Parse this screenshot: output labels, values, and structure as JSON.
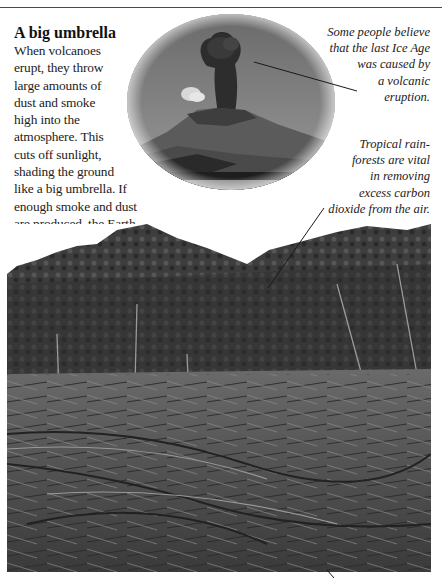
{
  "article": {
    "heading": "A big umbrella",
    "body_lines": [
      "When volcanoes",
      "erupt, they throw",
      "large amounts of",
      "dust and smoke",
      "high into the",
      "atmosphere. This",
      "cuts off sunlight,",
      "shading the ground",
      "like a big umbrella. If",
      "enough smoke and dust",
      "are produced, the Earth",
      "could get colder."
    ]
  },
  "captions": {
    "volcano": {
      "lines": [
        "Some people believe",
        "that the last Ice Age",
        "was caused by",
        "a volcanic",
        "eruption."
      ]
    },
    "forest": {
      "lines": [
        "Tropical rain-",
        "forests are vital",
        "in removing",
        "excess carbon",
        "dioxide from the air."
      ]
    }
  },
  "images": {
    "volcano_photo": "erupting-volcano",
    "forest_photo": "cleared-rainforest"
  },
  "colors": {
    "rule": "#4a4a4a",
    "text": "#1a1a1a"
  }
}
